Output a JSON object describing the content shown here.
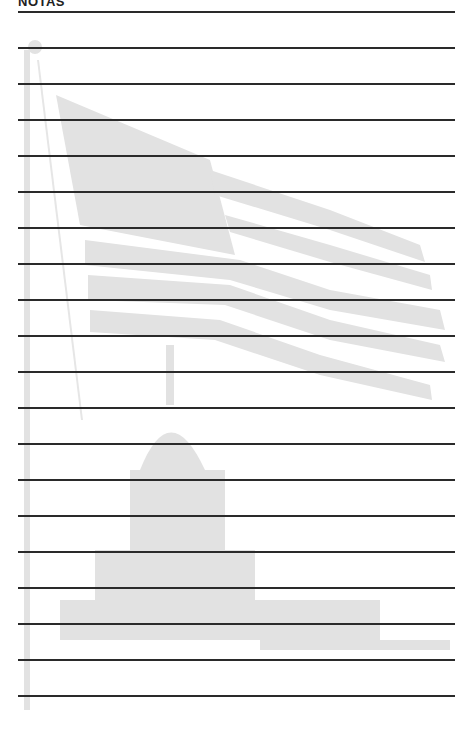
{
  "page": {
    "header": "NOTAS",
    "line_count": 20,
    "line_start_y": 11,
    "line_spacing": 36,
    "watermark": {
      "description": "faint illustration of a waving US flag on a pole over the Capitol dome",
      "color": "#d9d9d9"
    }
  }
}
